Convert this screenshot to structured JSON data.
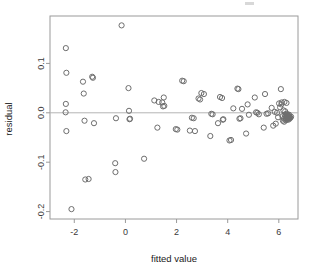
{
  "chart_data": {
    "type": "scatter",
    "title": "",
    "xlabel": "fitted value",
    "ylabel": "residual",
    "xlim": [
      -2.95,
      6.75
    ],
    "ylim": [
      -0.215,
      0.196
    ],
    "xticks": [
      -2,
      0,
      2,
      4,
      6
    ],
    "xtick_labels": [
      "-2",
      "0",
      "2",
      "4",
      "6"
    ],
    "yticks": [
      0.1,
      0.0,
      -0.1,
      -0.2
    ],
    "ytick_labels": [
      "0.1",
      "0.0",
      "-0.1",
      "-0.2"
    ],
    "grid": false,
    "legend": null,
    "reference_lines": [
      {
        "orientation": "horizontal",
        "value": 0.0,
        "color": "#b4b4b4"
      }
    ],
    "marker": {
      "shape": "open-circle",
      "radius": 2.6,
      "color": "#6e6e6e"
    },
    "series": [
      {
        "name": "residuals",
        "x": [
          -2.33,
          -2.31,
          -2.33,
          -2.34,
          -2.31,
          -2.11,
          -1.66,
          -1.63,
          -1.6,
          -1.57,
          -1.3,
          -1.27,
          -1.23,
          -1.44,
          -0.4,
          -0.39,
          -0.37,
          -0.15,
          0.12,
          0.14,
          0.16,
          0.18,
          0.73,
          1.13,
          1.25,
          1.3,
          1.44,
          1.47,
          1.5,
          1.52,
          1.97,
          2.03,
          2.22,
          2.28,
          2.52,
          2.6,
          2.67,
          2.72,
          2.86,
          2.92,
          2.97,
          3.07,
          3.32,
          3.36,
          3.41,
          3.62,
          3.7,
          3.78,
          3.81,
          3.83,
          4.07,
          4.13,
          4.22,
          4.38,
          4.42,
          4.46,
          4.5,
          4.56,
          4.72,
          4.78,
          4.83,
          5.06,
          5.11,
          5.16,
          5.22,
          5.41,
          5.46,
          5.52,
          5.58,
          5.72,
          5.78,
          5.84,
          5.88,
          5.93,
          5.97,
          6.01,
          6.05,
          6.08,
          6.11,
          6.14,
          6.16,
          6.18,
          6.2,
          6.21,
          6.23,
          6.25,
          6.26,
          6.27,
          6.28,
          6.29,
          6.3,
          6.31,
          6.32,
          6.33,
          6.34,
          6.35,
          6.36,
          6.37,
          6.38,
          6.39,
          6.4,
          6.41,
          6.42,
          6.43,
          6.1,
          6.22,
          6.3,
          6.45,
          6.48
        ],
        "y": [
          0.131,
          0.081,
          0.018,
          0.001,
          -0.037,
          -0.195,
          0.063,
          0.039,
          -0.016,
          -0.135,
          0.073,
          0.071,
          -0.021,
          -0.134,
          -0.102,
          -0.12,
          -0.011,
          0.177,
          0.05,
          0.004,
          -0.013,
          -0.012,
          -0.093,
          0.025,
          -0.03,
          0.022,
          0.021,
          0.013,
          0.031,
          0.014,
          -0.033,
          -0.034,
          0.065,
          0.064,
          -0.036,
          -0.01,
          -0.011,
          -0.037,
          0.029,
          0.027,
          0.04,
          0.038,
          -0.047,
          -0.002,
          -0.003,
          -0.021,
          0.032,
          0.03,
          -0.014,
          -0.013,
          -0.056,
          -0.055,
          0.009,
          0.049,
          0.048,
          -0.012,
          -0.011,
          0.008,
          -0.042,
          0.017,
          -0.004,
          0.031,
          0.001,
          0.0,
          -0.003,
          -0.03,
          0.038,
          -0.002,
          -0.001,
          0.01,
          -0.026,
          0.002,
          -0.022,
          0.0,
          -0.009,
          0.019,
          0.011,
          0.048,
          0.021,
          -0.007,
          -0.016,
          0.005,
          -0.012,
          -0.018,
          -0.004,
          0.003,
          -0.011,
          -0.006,
          -0.015,
          -0.002,
          -0.008,
          -0.013,
          -0.005,
          -0.009,
          -0.003,
          -0.01,
          -0.007,
          -0.014,
          -0.006,
          -0.011,
          -0.004,
          -0.008,
          -0.012,
          -0.009,
          0.017,
          0.022,
          0.02,
          -0.01,
          -0.008
        ]
      }
    ]
  },
  "axes": {
    "x_title": "fitted value",
    "y_title": "residual"
  }
}
